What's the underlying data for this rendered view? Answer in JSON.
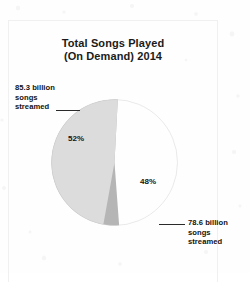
{
  "document": {
    "kind": "scanned-chart-figure",
    "background_color": "#fefefe",
    "frame_color": "#f0f0f0"
  },
  "chart_data": {
    "type": "pie",
    "title": "Total Songs Played (On Demand) 2014",
    "title_lines": [
      "Total Songs Played",
      "(On Demand) 2014"
    ],
    "xlabel": "",
    "ylabel": "",
    "legend_position": "callout-labels",
    "grid": false,
    "unit": "billion songs streamed",
    "categories": [
      "85.3 billion songs streamed",
      "78.6 billion songs streamed"
    ],
    "values": [
      85.3,
      78.6
    ],
    "percentages": [
      52,
      48
    ],
    "slices": [
      {
        "name": "85.3 billion songs streamed",
        "value": 85.3,
        "percent_label": "52%",
        "percent": 52,
        "color": "#b5b5b5",
        "callout_lines": [
          "85.3 billion",
          "songs",
          "streamed"
        ],
        "callout_side": "left"
      },
      {
        "name": "78.6 billion songs streamed",
        "value": 78.6,
        "percent_label": "48%",
        "percent": 48,
        "color": "#dcdcdc",
        "callout_lines": [
          "78.6 billion",
          "songs",
          "streamed"
        ],
        "callout_side": "right"
      }
    ],
    "colors": [
      "#b5b5b5",
      "#dcdcdc"
    ],
    "start_angle_deg": 3,
    "total_value": 163.9
  }
}
